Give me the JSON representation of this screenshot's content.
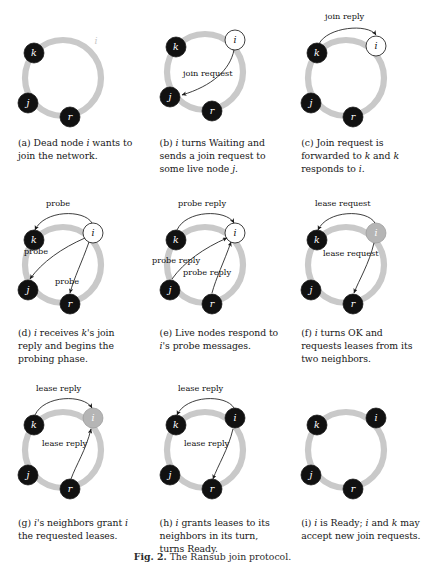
{
  "figure": {
    "number": "Fig. 2.",
    "caption_text": "The Ransub join protocol.",
    "full_caption": "Fig. 2. The Ransub join protocol."
  },
  "legend": {
    "node_states": {
      "dead": "Dead (black filled node)",
      "waiting": "Waiting (white/hollow node)",
      "ok": "OK (gray filled node)",
      "ready": "Ready (black filled node)"
    }
  },
  "panels": [
    {
      "id": "a",
      "label": "(a)",
      "caption": "(a) Dead node i wants to join the network.",
      "caption_parts": [
        "(a) Dead node ",
        "i",
        " wants to join the network."
      ],
      "nodes": [
        {
          "name": "k",
          "state": "dead",
          "x": 34,
          "y": 40
        },
        {
          "name": "j",
          "state": "dead",
          "x": 25,
          "y": 96
        },
        {
          "name": "r",
          "state": "dead",
          "x": 66,
          "y": 116
        },
        {
          "name": "i",
          "state": "ghost",
          "x": 96,
          "y": 33
        }
      ],
      "messages": []
    },
    {
      "id": "b",
      "label": "(b)",
      "caption": "(b) i turns Waiting and sends a join request to some live node j.",
      "caption_parts": [
        "(b) ",
        "i",
        " turns Waiting and sends a join request to some live node ",
        "j",
        "."
      ],
      "nodes": [
        {
          "name": "k",
          "state": "dead",
          "x": 34,
          "y": 40
        },
        {
          "name": "j",
          "state": "dead",
          "x": 25,
          "y": 96
        },
        {
          "name": "r",
          "state": "dead",
          "x": 66,
          "y": 116
        },
        {
          "name": "i",
          "state": "waiting",
          "x": 96,
          "y": 33
        }
      ],
      "messages": [
        {
          "text": "join request",
          "from": "i",
          "to": "j"
        }
      ]
    },
    {
      "id": "c",
      "label": "(c)",
      "caption": "(c) Join request is forwarded to k and k responds to i.",
      "caption_parts": [
        "(c) Join request is forwarded to ",
        "k",
        " and ",
        "k",
        " responds to ",
        "i",
        "."
      ],
      "nodes": [
        {
          "name": "k",
          "state": "dead",
          "x": 34,
          "y": 45
        },
        {
          "name": "j",
          "state": "dead",
          "x": 25,
          "y": 100
        },
        {
          "name": "r",
          "state": "dead",
          "x": 66,
          "y": 120
        },
        {
          "name": "i",
          "state": "waiting",
          "x": 96,
          "y": 38
        }
      ],
      "messages": [
        {
          "text": "join reply",
          "from": "k",
          "to": "i"
        }
      ]
    },
    {
      "id": "d",
      "label": "(d)",
      "caption": "(d) i receives k's join reply and begins the probing phase.",
      "caption_parts": [
        "(d) ",
        "i",
        " receives ",
        "k",
        "'s join reply and begins the probing phase."
      ],
      "nodes": [
        {
          "name": "k",
          "state": "dead",
          "x": 34,
          "y": 48
        },
        {
          "name": "j",
          "state": "dead",
          "x": 25,
          "y": 104
        },
        {
          "name": "r",
          "state": "dead",
          "x": 66,
          "y": 124
        },
        {
          "name": "i",
          "state": "waiting",
          "x": 96,
          "y": 41
        }
      ],
      "messages": [
        {
          "text": "probe",
          "from": "i",
          "to": "k"
        },
        {
          "text": "probe",
          "from": "i",
          "to": "j"
        },
        {
          "text": "probe",
          "from": "i",
          "to": "r"
        }
      ]
    },
    {
      "id": "e",
      "label": "(e)",
      "caption": "(e) Live nodes respond to i's probe messages.",
      "caption_parts": [
        "(e) Live nodes respond to ",
        "i",
        "'s probe messages."
      ],
      "nodes": [
        {
          "name": "k",
          "state": "dead",
          "x": 34,
          "y": 48
        },
        {
          "name": "j",
          "state": "dead",
          "x": 25,
          "y": 104
        },
        {
          "name": "r",
          "state": "dead",
          "x": 66,
          "y": 124
        },
        {
          "name": "i",
          "state": "waiting",
          "x": 96,
          "y": 41
        }
      ],
      "messages": [
        {
          "text": "probe reply",
          "from": "k",
          "to": "i"
        },
        {
          "text": "probe reply",
          "from": "j",
          "to": "i"
        },
        {
          "text": "probe reply",
          "from": "r",
          "to": "i"
        }
      ]
    },
    {
      "id": "f",
      "label": "(f)",
      "caption": "(f) i turns OK and requests leases from its two neighbors.",
      "caption_parts": [
        "(f) ",
        "i",
        " turns OK and requests leases from its two neighbors."
      ],
      "nodes": [
        {
          "name": "k",
          "state": "dead",
          "x": 34,
          "y": 48
        },
        {
          "name": "j",
          "state": "dead",
          "x": 25,
          "y": 104
        },
        {
          "name": "r",
          "state": "dead",
          "x": 66,
          "y": 124
        },
        {
          "name": "i",
          "state": "ok",
          "x": 96,
          "y": 41
        }
      ],
      "messages": [
        {
          "text": "lease request",
          "from": "i",
          "to": "k"
        },
        {
          "text": "lease request",
          "from": "i",
          "to": "r"
        }
      ]
    },
    {
      "id": "g",
      "label": "(g)",
      "caption": "(g) i's neighbors grant i the requested leases.",
      "caption_parts": [
        "(g) ",
        "i",
        "'s neighbors grant ",
        "i",
        " the requested leases."
      ],
      "nodes": [
        {
          "name": "k",
          "state": "dead",
          "x": 34,
          "y": 43
        },
        {
          "name": "j",
          "state": "dead",
          "x": 25,
          "y": 99
        },
        {
          "name": "r",
          "state": "dead",
          "x": 66,
          "y": 119
        },
        {
          "name": "i",
          "state": "ok",
          "x": 96,
          "y": 36
        }
      ],
      "messages": [
        {
          "text": "lease reply",
          "from": "k",
          "to": "i"
        },
        {
          "text": "lease reply",
          "from": "r",
          "to": "i"
        }
      ]
    },
    {
      "id": "h",
      "label": "(h)",
      "caption": "(h) i grants leases to its neighbors in its turn, turns Ready.",
      "caption_parts": [
        "(h) ",
        "i",
        " grants leases to its neighbors in its turn, turns Ready."
      ],
      "nodes": [
        {
          "name": "k",
          "state": "dead",
          "x": 34,
          "y": 43
        },
        {
          "name": "j",
          "state": "dead",
          "x": 25,
          "y": 99
        },
        {
          "name": "r",
          "state": "dead",
          "x": 66,
          "y": 119
        },
        {
          "name": "i",
          "state": "ready",
          "x": 96,
          "y": 36
        }
      ],
      "messages": [
        {
          "text": "lease reply",
          "from": "i",
          "to": "k"
        },
        {
          "text": "lease reply",
          "from": "i",
          "to": "r"
        }
      ]
    },
    {
      "id": "i",
      "label": "(i)",
      "caption": "(i) i is Ready; i and k may accept new join requests.",
      "caption_parts": [
        "(i) ",
        "i",
        " is Ready; ",
        "i",
        " and ",
        "k",
        " may accept new join requests."
      ],
      "nodes": [
        {
          "name": "k",
          "state": "dead",
          "x": 34,
          "y": 43
        },
        {
          "name": "j",
          "state": "dead",
          "x": 25,
          "y": 99
        },
        {
          "name": "r",
          "state": "dead",
          "x": 66,
          "y": 119
        },
        {
          "name": "i",
          "state": "ready",
          "x": 96,
          "y": 36
        }
      ],
      "messages": []
    }
  ],
  "colors": {
    "ring": "#c9c9c9",
    "node_dead": "#111111",
    "node_ok": "#b5b5b5",
    "node_waiting_fill": "#ffffff",
    "node_waiting_stroke": "#2a2a2a",
    "arrow": "#1b1b1b",
    "text": "#171717",
    "background": "#ffffff"
  },
  "message_labels": {
    "join_request": "join request",
    "join_reply": "join reply",
    "probe": "probe",
    "probe_reply": "probe reply",
    "lease_request": "lease request",
    "lease_reply": "lease reply"
  }
}
